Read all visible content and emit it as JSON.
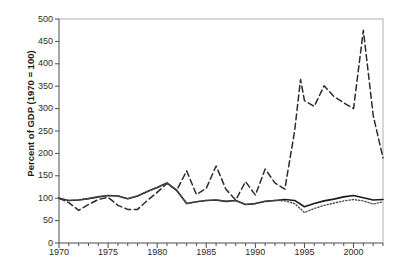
{
  "chart_data": {
    "type": "line",
    "title": "",
    "xlabel": "",
    "ylabel": "Percent of GDP (1970 = 100)",
    "xlim": [
      1970,
      2003
    ],
    "ylim": [
      0,
      500
    ],
    "grid": false,
    "legend": "none",
    "yticks": [
      0,
      50,
      100,
      150,
      200,
      250,
      300,
      350,
      400,
      450,
      500
    ],
    "ytick_labels": [
      "0",
      "50",
      "100",
      "150",
      "200",
      "250",
      "300",
      "350",
      "400",
      "450",
      "500"
    ],
    "xticks": [
      1970,
      1975,
      1980,
      1985,
      1990,
      1995,
      2000
    ],
    "xtick_labels": [
      "1970",
      "1975",
      "1980",
      "1985",
      "1990",
      "1995",
      "2000"
    ],
    "x_minor_tick_interval": 1,
    "y_minor_tick_interval": 50,
    "axis_color": "#4d4d4d",
    "series": [
      {
        "name": "solid-series",
        "style": "solid",
        "color": "#1a1a1a",
        "width": 1.6,
        "x": [
          1970,
          1971,
          1972,
          1973,
          1974,
          1975,
          1976,
          1977,
          1978,
          1979,
          1980,
          1981,
          1982,
          1983,
          1984,
          1985,
          1986,
          1987,
          1988,
          1989,
          1990,
          1991,
          1992,
          1993,
          1994,
          1995,
          1996,
          1997,
          1998,
          1999,
          2000,
          2001,
          2002,
          2003
        ],
        "values": [
          100,
          95,
          96,
          99,
          103,
          106,
          105,
          99,
          105,
          115,
          124,
          134,
          117,
          88,
          92,
          95,
          96,
          93,
          95,
          86,
          88,
          93,
          95,
          97,
          95,
          81,
          88,
          94,
          98,
          103,
          106,
          101,
          96,
          97
        ]
      },
      {
        "name": "dashed-series",
        "style": "dashed",
        "color": "#2b2b2b",
        "width": 1.5,
        "x": [
          1970,
          1971,
          1972,
          1973,
          1974,
          1975,
          1976,
          1977,
          1978,
          1979,
          1980,
          1981,
          1982,
          1983,
          1984,
          1985,
          1986,
          1987,
          1988,
          1989,
          1990,
          1991,
          1992,
          1993,
          1994,
          1994.6,
          1995,
          1996,
          1997,
          1998,
          1999,
          2000,
          2001,
          2002,
          2003
        ],
        "values": [
          100,
          90,
          73,
          86,
          97,
          102,
          84,
          75,
          75,
          95,
          113,
          133,
          118,
          161,
          108,
          122,
          172,
          120,
          96,
          137,
          107,
          165,
          134,
          120,
          250,
          365,
          318,
          305,
          351,
          327,
          313,
          300,
          475,
          285,
          190
        ]
      },
      {
        "name": "dotted-series",
        "style": "dotted",
        "color": "#4d4d4d",
        "width": 1.4,
        "x": [
          1970,
          1971,
          1972,
          1973,
          1974,
          1975,
          1976,
          1977,
          1978,
          1979,
          1980,
          1981,
          1982,
          1983,
          1984,
          1985,
          1986,
          1987,
          1988,
          1989,
          1990,
          1991,
          1992,
          1993,
          1994,
          1995,
          1996,
          1997,
          1998,
          1999,
          2000,
          2001,
          2002,
          2003
        ],
        "values": [
          100,
          95,
          96,
          99,
          103,
          106,
          105,
          99,
          105,
          115,
          124,
          134,
          117,
          88,
          92,
          95,
          96,
          93,
          95,
          86,
          88,
          93,
          95,
          94,
          88,
          68,
          77,
          84,
          89,
          94,
          97,
          94,
          87,
          92
        ]
      }
    ]
  }
}
